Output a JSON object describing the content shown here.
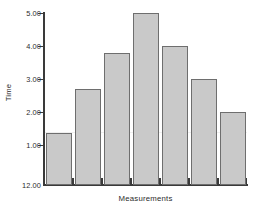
{
  "chart_data": {
    "type": "bar",
    "title": "",
    "xlabel": "Measurements",
    "ylabel": "Time",
    "categories": [
      "1",
      "2",
      "3",
      "4",
      "5",
      "6",
      "7"
    ],
    "values": [
      1.35,
      2.7,
      3.8,
      5.0,
      4.0,
      3.0,
      2.0
    ],
    "ylim": [
      0.0,
      5.0
    ],
    "ytick_labels": [
      "5.00",
      "4.00",
      "3.00",
      "2.00",
      "1.00",
      "12.00"
    ],
    "ytick_values": [
      5.0,
      4.0,
      3.0,
      2.0,
      1.0,
      0.0
    ],
    "grid": false,
    "legend": false,
    "bar_fill_color": "#c9c9c9",
    "bar_edge_color": "#6e6e6e",
    "axis_color": "#3a3a3a"
  },
  "figure": {
    "clipped_title": "",
    "y_axis_title": "Time",
    "x_axis_title": "Measurements"
  }
}
